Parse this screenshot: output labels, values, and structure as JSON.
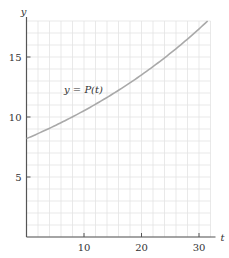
{
  "chart_data": {
    "type": "line",
    "title": "",
    "xlabel": "t",
    "ylabel": "y",
    "xlim": [
      0,
      32
    ],
    "ylim": [
      0,
      18
    ],
    "grid": true,
    "grid_step_x": 2,
    "grid_step_y": 1,
    "x_ticks": [
      10,
      20,
      30
    ],
    "y_ticks": [
      5,
      10,
      15
    ],
    "x_tick_labels": [
      "10",
      "20",
      "30"
    ],
    "y_tick_labels": [
      "5",
      "10",
      "15"
    ],
    "series": [
      {
        "name": "y = P(t)",
        "x": [
          0,
          4,
          8,
          12,
          16,
          20,
          24,
          28,
          31.5
        ],
        "values": [
          8.2,
          9.1,
          10.0,
          11.1,
          12.2,
          13.5,
          15.0,
          16.5,
          18.0
        ]
      }
    ],
    "annotations": [
      {
        "text": "y = P(t)",
        "x": 12.5,
        "y": 12.2
      }
    ],
    "colors": {
      "curve": "#a9a9a9",
      "axis": "#555555",
      "grid": "#e3e3e3"
    }
  }
}
